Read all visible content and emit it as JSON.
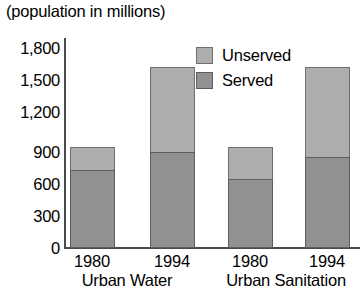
{
  "chart_data": {
    "type": "bar",
    "title": "(population in millions)",
    "subtitle": "",
    "xlabel": "",
    "ylabel": "",
    "stacked": true,
    "grid": false,
    "legend_position": "inside-top-right",
    "ylim": [
      0,
      1800
    ],
    "yticks": [
      "0",
      "300",
      "600",
      "900",
      "1,200",
      "1,500",
      "1,800"
    ],
    "ytick_values": [
      0,
      300,
      600,
      900,
      1200,
      1500,
      1800
    ],
    "categories": [
      "1980",
      "1994",
      "1980",
      "1994"
    ],
    "groups": [
      {
        "label": "Urban Water",
        "categories": [
          "1980",
          "1994"
        ]
      },
      {
        "label": "Urban Sanitation",
        "categories": [
          "1980",
          "1994"
        ]
      }
    ],
    "series": [
      {
        "name": "Served",
        "color": "#919191",
        "values": [
          730,
          900,
          650,
          850
        ]
      },
      {
        "name": "Unserved",
        "color": "#adadad",
        "values": [
          220,
          800,
          300,
          850
        ]
      }
    ],
    "totals": [
      950,
      1700,
      950,
      1700
    ],
    "bars": [
      {
        "category": "1980",
        "group": "Urban Water",
        "served": 730,
        "unserved": 220,
        "total": 950
      },
      {
        "category": "1994",
        "group": "Urban Water",
        "served": 900,
        "unserved": 800,
        "total": 1700
      },
      {
        "category": "1980",
        "group": "Urban Sanitation",
        "served": 650,
        "unserved": 300,
        "total": 950
      },
      {
        "category": "1994",
        "group": "Urban Sanitation",
        "served": 850,
        "unserved": 850,
        "total": 1700
      }
    ]
  },
  "legend": {
    "items": [
      {
        "label": "Unserved",
        "color": "#adadad"
      },
      {
        "label": "Served",
        "color": "#919191"
      }
    ]
  },
  "axis": {
    "y_labels": [
      "1,800",
      "1,500",
      "1,200",
      "900",
      "600",
      "300",
      "0"
    ],
    "x_labels": [
      "1980",
      "1994",
      "1980",
      "1994"
    ],
    "group_labels": [
      "Urban Water",
      "Urban Sanitation"
    ]
  },
  "colors": {
    "unserved": "#adadad",
    "served": "#919191",
    "axis": "#4a4a4a",
    "text": "#000000",
    "background": "#ffffff"
  }
}
